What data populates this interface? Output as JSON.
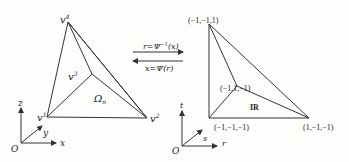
{
  "left_diagram": {
    "vertices": {
      "v1": {
        "label": "v",
        "sup": "1"
      },
      "v2": {
        "label": "v",
        "sup": "2"
      },
      "v3": {
        "label": "v",
        "sup": "3"
      },
      "v4": {
        "label": "v",
        "sup": "4"
      }
    },
    "region_label": "Ω",
    "region_sub": "n",
    "axes": {
      "origin": "O",
      "x": "x",
      "y": "y",
      "z": "z"
    }
  },
  "mapping": {
    "forward": "r=Ψ",
    "forward_sup": "−1",
    "forward_arg": "(x)",
    "inverse": "x=Ψ(r)"
  },
  "right_diagram": {
    "vertices": {
      "top": "(−1,−1,1)",
      "inner": "(−1,1,−1)",
      "bottom_left": "(−1,−1,−1)",
      "bottom_right": "(1,−1,−1)"
    },
    "region_label": "IR",
    "axes": {
      "origin": "O",
      "r": "r",
      "s": "s",
      "t": "t"
    }
  }
}
